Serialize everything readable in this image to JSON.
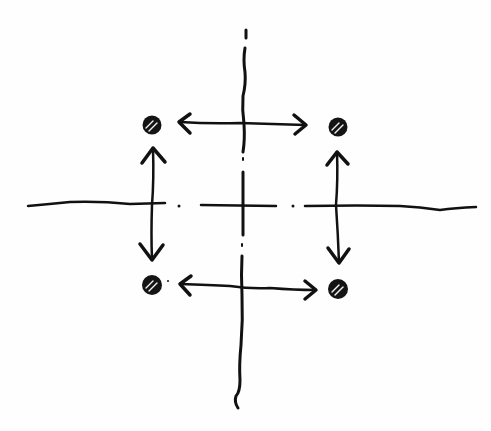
{
  "diagram": {
    "ink_color": "#111111",
    "background_color": "#fefefe",
    "center_lines": {
      "vertical": {
        "x": 242,
        "y1": 28,
        "y2": 408,
        "style": "dash-dot"
      },
      "horizontal": {
        "y": 205,
        "x1": 28,
        "x2": 476,
        "style": "dash-dot"
      }
    },
    "holes": [
      {
        "id": "top-left",
        "cx": 152,
        "cy": 125,
        "r": 9,
        "fill": "hatched"
      },
      {
        "id": "top-right",
        "cx": 338,
        "cy": 127,
        "r": 9,
        "fill": "hatched"
      },
      {
        "id": "bottom-left",
        "cx": 152,
        "cy": 285,
        "r": 9,
        "fill": "hatched"
      },
      {
        "id": "bottom-right",
        "cx": 338,
        "cy": 289,
        "r": 9,
        "fill": "hatched"
      }
    ],
    "dimension_arrows": [
      {
        "id": "top-horizontal",
        "from": [
          180,
          122
        ],
        "to": [
          306,
          125
        ],
        "heads": "both"
      },
      {
        "id": "bottom-horizontal",
        "from": [
          180,
          284
        ],
        "to": [
          316,
          290
        ],
        "heads": "both"
      },
      {
        "id": "left-vertical",
        "from": [
          153,
          148
        ],
        "to": [
          153,
          260
        ],
        "heads": "both"
      },
      {
        "id": "right-vertical",
        "from": [
          337,
          152
        ],
        "to": [
          339,
          262
        ],
        "heads": "both"
      }
    ]
  }
}
